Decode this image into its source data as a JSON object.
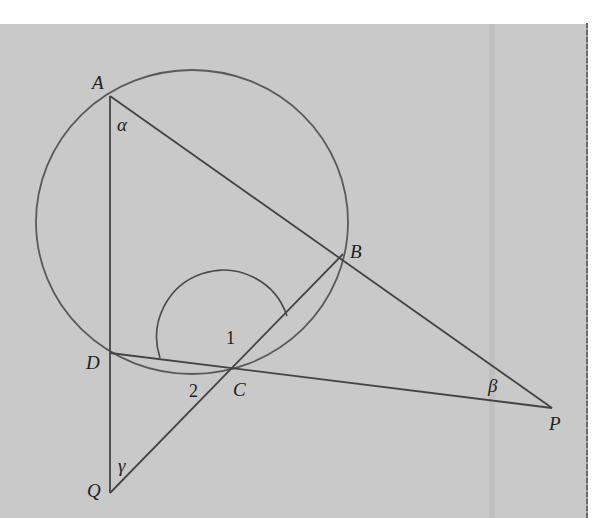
{
  "figure": {
    "points": {
      "A": {
        "label": "A",
        "x": 110,
        "y": 96
      },
      "B": {
        "label": "B",
        "x": 343,
        "y": 254
      },
      "C": {
        "label": "C",
        "x": 232,
        "y": 374
      },
      "D": {
        "label": "D",
        "x": 110,
        "y": 353
      },
      "P": {
        "label": "P",
        "x": 552,
        "y": 408
      },
      "Q": {
        "label": "Q",
        "x": 110,
        "y": 493
      }
    },
    "angles": {
      "alpha": "α",
      "beta": "β",
      "gamma": "γ",
      "angle1": "1",
      "angle2": "2"
    },
    "segments": [
      "AQ",
      "AP",
      "DP",
      "QB"
    ],
    "circle": {
      "passes_through": [
        "A",
        "B",
        "C",
        "D"
      ],
      "cx": 192,
      "cy": 222,
      "r": 155
    },
    "colors": {
      "background": "#c9c9c9",
      "stroke": "#4a4a4a",
      "circle_stroke": "#5a5a5a",
      "text": "#1e1e1e"
    }
  }
}
